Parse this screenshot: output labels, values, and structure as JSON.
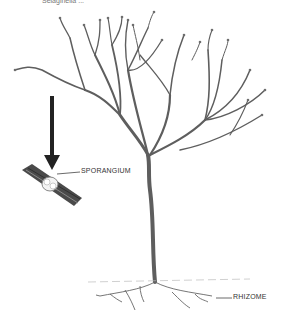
{
  "caption": "Selaginella ...",
  "labels": {
    "sporangium": "SPORANGIUM",
    "rhizome": "RHIZOME"
  },
  "colors": {
    "stem": "#5a5a5a",
    "arrow": "#222222",
    "text": "#333333"
  }
}
